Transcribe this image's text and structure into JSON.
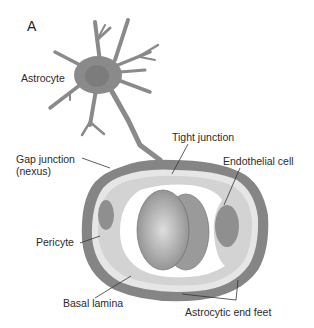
{
  "figure": {
    "panel_letter": "A",
    "colors": {
      "astrocyte": "#8a8a8a",
      "astrocyte_nucleus": "#7c7c7c",
      "end_feet": "#858585",
      "basal_lamina": "#e6e6e6",
      "endothelium": "#d3d3d3",
      "lumen": "#ffffff",
      "pericyte": "#8f8f8f",
      "erythrocyte": "#9a9a9a",
      "leader_line": "#333333",
      "text": "#2a2a2a"
    },
    "labels": {
      "astrocyte": "Astrocyte",
      "tight_junction": "Tight junction",
      "gap_junction_line1": "Gap junction",
      "gap_junction_line2": "(nexus)",
      "endothelial_cell": "Endothelial cell",
      "pericyte": "Pericyte",
      "basal_lamina": "Basal lamina",
      "astrocytic_end_feet": "Astrocytic end feet"
    }
  }
}
